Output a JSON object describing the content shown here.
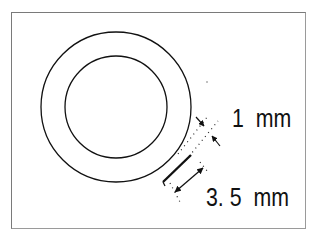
{
  "diagram": {
    "type": "ring cross-section with dimensions",
    "labels": {
      "thickness": "1  mm",
      "gap": "3. 5  mm"
    },
    "shapes": {
      "outer_circle": {
        "cx": 116,
        "cy": 107,
        "r": 75
      },
      "inner_circle": {
        "cx": 116,
        "cy": 107,
        "r": 51
      }
    },
    "colors": {
      "stroke": "#111111",
      "frame": "#7a7a7a",
      "background": "#ffffff"
    }
  }
}
